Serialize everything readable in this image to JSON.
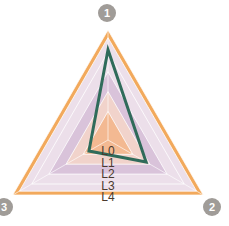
{
  "chart_data": {
    "type": "radar",
    "title": "",
    "axes": [
      "1",
      "2",
      "3"
    ],
    "levels": [
      "L0",
      "L1",
      "L2",
      "L3",
      "L4"
    ],
    "range": [
      0,
      1
    ],
    "series": [
      {
        "name": "series-1",
        "values": [
          0.82,
          0.4,
          0.2
        ],
        "color": "#2f6b5a"
      }
    ],
    "level_colors": [
      "#f3b992",
      "#f1d3cb",
      "#d9c3da",
      "#ecdfea",
      "#f2a95c"
    ],
    "axis_marker_color": "#a09c98",
    "grid": true,
    "legend": "none"
  },
  "geometry": {
    "cx": 108,
    "cy": 140,
    "radius": 110
  }
}
